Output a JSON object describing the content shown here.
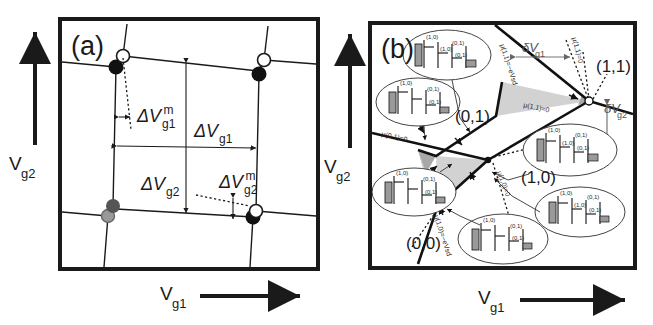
{
  "figure": {
    "caption_panels": [
      "(a)",
      "(b)"
    ],
    "background": "#ffffff",
    "ink": "#1a1a1a"
  },
  "panel_a": {
    "label": "(a)",
    "axis_x": {
      "symbol": "V",
      "subscript": "g1",
      "arrow": "right"
    },
    "axis_y": {
      "symbol": "V",
      "subscript": "g2",
      "arrow": "up"
    },
    "annotations": [
      {
        "name": "delta-vg1-m",
        "symbol": "ΔV",
        "sub": "g1",
        "sup": "m"
      },
      {
        "name": "delta-vg1",
        "symbol": "ΔV",
        "sub": "g1",
        "sup": ""
      },
      {
        "name": "delta-vg2",
        "symbol": "ΔV",
        "sub": "g2",
        "sup": ""
      },
      {
        "name": "delta-vg2-m",
        "symbol": "ΔV",
        "sub": "g2",
        "sup": "m"
      }
    ],
    "vertex_dots": [
      {
        "type": "filled",
        "color": "#111111"
      },
      {
        "type": "open",
        "color": "#ffffff"
      },
      {
        "type": "gray",
        "color": "#777777"
      }
    ],
    "description": "honeycomb charge stability diagram with triple-point dots"
  },
  "panel_b": {
    "label": "(b)",
    "axis_x": {
      "symbol": "V",
      "subscript": "g1",
      "arrow": "right"
    },
    "axis_y": {
      "symbol": "V",
      "subscript": "g2",
      "arrow": "up"
    },
    "charge_states": [
      "(1,1)",
      "(0,1)",
      "(1,0)",
      "(0,0)"
    ],
    "bias_labels": [
      {
        "name": "delta-vg1",
        "symbol": "δV",
        "sub": "g1"
      },
      {
        "name": "delta-vg2",
        "symbol": "δV",
        "sub": "g2"
      }
    ],
    "mu_lines": [
      "μ(1,1)=−eVsd",
      "μ(1,1)=0",
      "μ(0,1)=0",
      "μ(1,0)=0",
      "μ(1,0)=−eVsd"
    ],
    "insets": [
      {
        "name": "inset-top",
        "levels": [
          "(1,0)",
          "(1,0)",
          "(0,1)",
          "(0,1)"
        ]
      },
      {
        "name": "inset-left-upper",
        "levels": [
          "(1,0)",
          "(0,1)",
          "(0,1)"
        ]
      },
      {
        "name": "inset-left-lower",
        "levels": [
          "(1,0)",
          "(0,1)",
          "(0,1)"
        ]
      },
      {
        "name": "inset-right-upper",
        "levels": [
          "(1,0)",
          "(0,1)",
          "(1,0)",
          "(0,1)"
        ]
      },
      {
        "name": "inset-right-lower",
        "levels": [
          "(1,0)",
          "(0,1)",
          "(1,0)",
          "(0,1)"
        ]
      },
      {
        "name": "inset-bottom",
        "levels": [
          "(1,0)",
          "(0,1)",
          "(0,1)"
        ]
      }
    ],
    "triangle_fill_dark": "#a8a8a8",
    "triangle_fill_light": "#d2d2d2",
    "description": "bias triangles at triple points with electrochemical potential ladders"
  }
}
